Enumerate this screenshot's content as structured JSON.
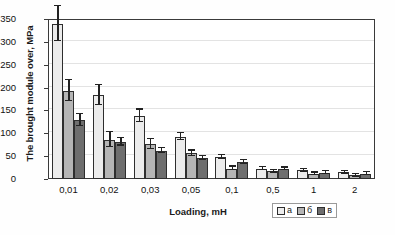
{
  "chart_data": {
    "type": "bar",
    "title": "",
    "xlabel": "Loading, mH",
    "ylabel": "The brought module over, MPa",
    "categories": [
      "0,01",
      "0,02",
      "0,03",
      "0,05",
      "0,1",
      "0,5",
      "1",
      "2"
    ],
    "ylim": [
      0,
      350
    ],
    "yticks": [
      0,
      50,
      100,
      150,
      200,
      250,
      300,
      350
    ],
    "grid": true,
    "legend_position": "bottom-right",
    "series": [
      {
        "name": "а",
        "color": "#ececec",
        "values": [
          340,
          184,
          138,
          93,
          48,
          23,
          19,
          15
        ],
        "errors": [
          38,
          22,
          14,
          8,
          4,
          3,
          3,
          3
        ]
      },
      {
        "name": "б",
        "color": "#b5b5b5",
        "values": [
          193,
          86,
          76,
          56,
          23,
          17,
          11,
          8
        ],
        "errors": [
          23,
          16,
          11,
          6,
          4,
          3,
          3,
          3
        ]
      },
      {
        "name": "в",
        "color": "#6e6e6e",
        "values": [
          129,
          81,
          62,
          46,
          37,
          22,
          14,
          12
        ],
        "errors": [
          13,
          8,
          6,
          5,
          4,
          3,
          3,
          3
        ]
      }
    ]
  }
}
